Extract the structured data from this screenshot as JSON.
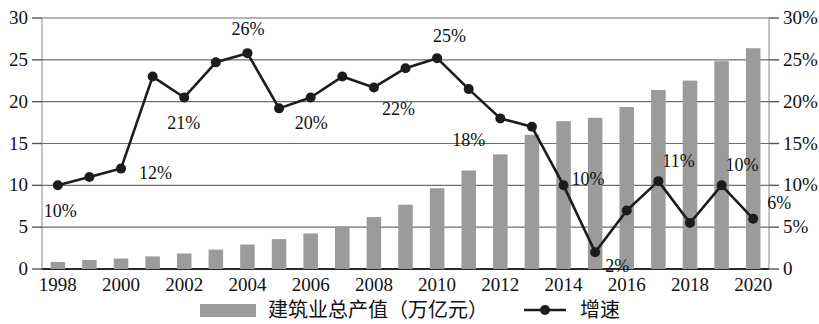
{
  "chart_data": {
    "type": "bar",
    "title": "",
    "xlabel": "",
    "ylabel": "",
    "grid": true,
    "legend_position": "bottom",
    "categories": [
      "1998",
      "1999",
      "2000",
      "2001",
      "2002",
      "2003",
      "2004",
      "2005",
      "2006",
      "2007",
      "2008",
      "2009",
      "2010",
      "2011",
      "2012",
      "2013",
      "2014",
      "2015",
      "2016",
      "2017",
      "2018",
      "2019",
      "2020"
    ],
    "x_tick_labels": [
      "1998",
      "2000",
      "2002",
      "2004",
      "2006",
      "2008",
      "2010",
      "2012",
      "2014",
      "2016",
      "2018",
      "2020"
    ],
    "left_axis": {
      "ticks": [
        "0",
        "5",
        "10",
        "15",
        "20",
        "25",
        "30"
      ],
      "ylim": [
        0,
        30
      ],
      "unit": "万亿元"
    },
    "right_axis": {
      "ticks": [
        "0",
        "5%",
        "10%",
        "15%",
        "20%",
        "25%",
        "30%"
      ],
      "ylim": [
        0,
        30
      ],
      "unit": "%"
    },
    "series": [
      {
        "name": "建筑业总产值（万亿元）",
        "type": "bar",
        "axis": "left",
        "color": "#9b9b9b",
        "values": [
          0.84,
          1.07,
          1.25,
          1.5,
          1.85,
          2.32,
          2.92,
          3.57,
          4.25,
          5.1,
          6.21,
          7.68,
          9.66,
          11.77,
          13.7,
          16.04,
          17.67,
          18.07,
          19.36,
          21.4,
          22.52,
          24.84,
          26.39
        ]
      },
      {
        "name": "增速",
        "type": "line",
        "axis": "right",
        "color": "#1c1c1c",
        "values": [
          10,
          11,
          12,
          23,
          20.5,
          24.7,
          25.8,
          19.2,
          20.5,
          23,
          21.7,
          24,
          25.2,
          21.5,
          18,
          17,
          10,
          2,
          7,
          10.5,
          5.5,
          10,
          6
        ]
      }
    ],
    "annotations": [
      {
        "text": "10%",
        "x_index": 0,
        "value": 10,
        "dx": -14,
        "dy": 26
      },
      {
        "text": "12%",
        "x_index": 2,
        "value": 12,
        "dx": 18,
        "dy": 4
      },
      {
        "text": "21%",
        "x_index": 4,
        "value": 20.5,
        "dx": -17,
        "dy": 26
      },
      {
        "text": "26%",
        "x_index": 6,
        "value": 25.8,
        "dx": -16,
        "dy": -24
      },
      {
        "text": "20%",
        "x_index": 8,
        "value": 20.5,
        "dx": -16,
        "dy": 26
      },
      {
        "text": "22%",
        "x_index": 10,
        "value": 21.7,
        "dx": 8,
        "dy": 22
      },
      {
        "text": "25%",
        "x_index": 12,
        "value": 25.2,
        "dx": -4,
        "dy": -22
      },
      {
        "text": "18%",
        "x_index": 14,
        "value": 18,
        "dx": -48,
        "dy": 22
      },
      {
        "text": "10%",
        "x_index": 16,
        "value": 10,
        "dx": 8,
        "dy": -6
      },
      {
        "text": "2%",
        "x_index": 17,
        "value": 2,
        "dx": 10,
        "dy": 14
      },
      {
        "text": "11%",
        "x_index": 19,
        "value": 10.5,
        "dx": 4,
        "dy": -20
      },
      {
        "text": "10%",
        "x_index": 21,
        "value": 10,
        "dx": 4,
        "dy": -20
      },
      {
        "text": "6%",
        "x_index": 22,
        "value": 6,
        "dx": 14,
        "dy": -16
      }
    ]
  },
  "legend": {
    "bar_label": "建筑业总产值（万亿元）",
    "line_label": "增速"
  }
}
